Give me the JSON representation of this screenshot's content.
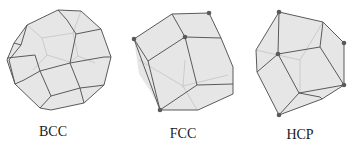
{
  "caption_fragment": "",
  "figure": {
    "panels": [
      {
        "id": "bcc",
        "label": "BCC",
        "shape": "truncated-octahedron",
        "label_x": 53,
        "label_y": 124
      },
      {
        "id": "fcc",
        "label": "FCC",
        "shape": "rhombic-dodecahedron",
        "label_x": 183,
        "label_y": 126
      },
      {
        "id": "hcp",
        "label": "HCP",
        "shape": "trapezo-rhombic-dodecahedron",
        "label_x": 300,
        "label_y": 127
      }
    ],
    "colors": {
      "face": "#e6e6e6",
      "edge": "#5a5a5a",
      "hidden_edge": "#c4c4c4",
      "vertex_dot": "#5a5a5a",
      "label": "#1a1a1a"
    }
  }
}
